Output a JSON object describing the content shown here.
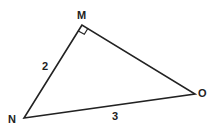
{
  "diagram": {
    "type": "right-triangle",
    "vertices": {
      "M": {
        "label": "M",
        "right_angle": true
      },
      "N": {
        "label": "N"
      },
      "O": {
        "label": "O"
      }
    },
    "sides": {
      "MN": {
        "label": "2"
      },
      "NO": {
        "label": "3"
      },
      "MO": {
        "label": ""
      }
    },
    "colors": {
      "stroke": "#222222",
      "background": "#ffffff"
    }
  }
}
